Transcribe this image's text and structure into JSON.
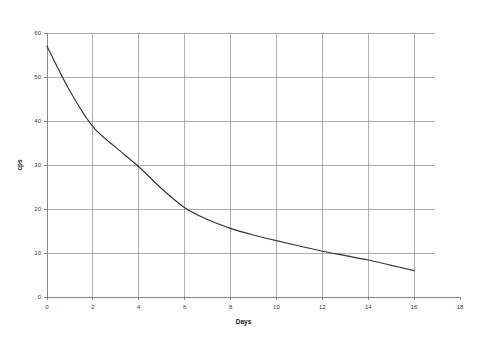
{
  "chart_data": {
    "type": "line",
    "title": "",
    "xlabel": "Days",
    "ylabel": "cps",
    "xlim": [
      0,
      18
    ],
    "ylim": [
      0,
      60
    ],
    "x_ticks": [
      0,
      2,
      4,
      6,
      8,
      10,
      12,
      14,
      16,
      18
    ],
    "y_ticks": [
      0,
      10,
      20,
      30,
      40,
      50,
      60
    ],
    "grid": true,
    "grid_x_extent": [
      0,
      16
    ],
    "legend": "none",
    "series": [
      {
        "name": "cps decay",
        "x": [
          0,
          1,
          2,
          3,
          4,
          5,
          6,
          7,
          8,
          9,
          10,
          11,
          12,
          13,
          14,
          15,
          16
        ],
        "values": [
          57.0,
          46.8,
          38.7,
          34.0,
          29.6,
          24.6,
          20.3,
          17.6,
          15.6,
          14.1,
          12.8,
          11.6,
          10.4,
          9.4,
          8.4,
          7.2,
          6.0
        ]
      }
    ]
  },
  "axes": {
    "x_tick_labels": [
      "0",
      "2",
      "4",
      "6",
      "8",
      "10",
      "12",
      "14",
      "16",
      "18"
    ],
    "y_tick_labels": [
      "0",
      "10",
      "20",
      "30",
      "40",
      "50",
      "60"
    ],
    "x_axis_title": "Days",
    "y_axis_title": "cps"
  },
  "colors": {
    "curve": "#333333",
    "gridline": "#8c8c8c",
    "axis": "#6b6b6b",
    "text": "#3a3a3a",
    "background": "#ffffff"
  }
}
